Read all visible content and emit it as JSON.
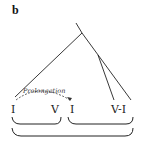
{
  "figure": {
    "panel_label": "b",
    "annotation": "Prolongation",
    "leaves": [
      {
        "label": "I",
        "x": 14
      },
      {
        "label": "V",
        "x": 55
      },
      {
        "label": "I",
        "x": 73
      },
      {
        "label": "V-I",
        "x": 122
      }
    ],
    "groups": [
      {
        "name": "group-I-V",
        "span": "I V"
      },
      {
        "name": "group-I-V-I",
        "span": "I V-I"
      },
      {
        "name": "group-all",
        "span": "I V I V-I"
      }
    ]
  }
}
